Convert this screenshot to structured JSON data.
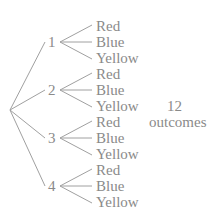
{
  "tree": {
    "branches": [
      {
        "label": "1",
        "leaves": [
          "Red",
          "Blue",
          "Yellow"
        ]
      },
      {
        "label": "2",
        "leaves": [
          "Red",
          "Blue",
          "Yellow"
        ]
      },
      {
        "label": "3",
        "leaves": [
          "Red",
          "Blue",
          "Yellow"
        ]
      },
      {
        "label": "4",
        "leaves": [
          "Red",
          "Blue",
          "Yellow"
        ]
      }
    ],
    "summary_count": "12",
    "summary_label": "outcomes"
  },
  "colors": {
    "line": "#9a9a9a",
    "text": "#8a8a8a"
  }
}
